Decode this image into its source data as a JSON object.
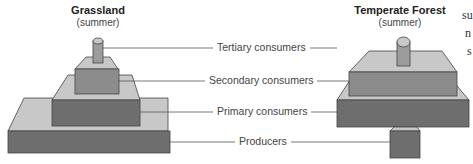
{
  "left_pyramid": {
    "title": "Grassland",
    "subtitle": "(summer)"
  },
  "right_pyramid": {
    "title": "Temperate Forest",
    "subtitle": "(summer)"
  },
  "levels": [
    {
      "label": "Tertiary consumers"
    },
    {
      "label": "Secondary consumers"
    },
    {
      "label": "Primary consumers"
    },
    {
      "label": "Producers"
    }
  ],
  "side_text": [
    "su",
    "n",
    "s"
  ],
  "colors": {
    "top_face": "#c8c8c8",
    "front_dark": "#6e6e6e",
    "front_mid": "#8c8c8c",
    "edge": "#444444"
  }
}
